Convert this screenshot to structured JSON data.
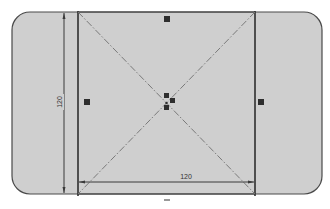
{
  "sketch": {
    "background_color": "#ffffff",
    "region_fill": "#cfcfcf",
    "line_color": "#3a3a3a",
    "centerline_color": "#7a7a7a",
    "handle_color": "#2e2e2e",
    "outer_profile": {
      "type": "rounded-rectangle",
      "x": 12,
      "y": 12,
      "width": 310,
      "height": 182,
      "corner_radius": 18
    },
    "square": {
      "x1": 78,
      "y1": 12,
      "x2": 255,
      "y2": 194
    },
    "diagonals": "dash-dot construction lines corner to corner",
    "center_handles": 3,
    "edge_handles": [
      "top",
      "left",
      "right"
    ]
  },
  "dimensions": {
    "horizontal": {
      "value": "120",
      "y": 182
    },
    "vertical": {
      "value": "120",
      "x": 64
    }
  }
}
